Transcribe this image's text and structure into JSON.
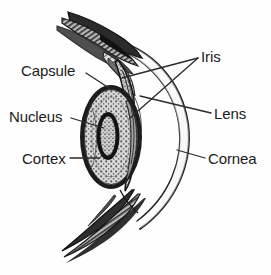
{
  "figure": {
    "style": "grayscale pen-and-ink medical illustration",
    "background_color": "#fefefe",
    "ink_color": "#1b1b1b",
    "leader_line_color": "#2a2a2a"
  },
  "labels": {
    "capsule": "Capsule",
    "nucleus": "Nucleus",
    "cortex": "Cortex",
    "iris": "Iris",
    "lens": "Lens",
    "cornea": "Cornea"
  },
  "structures": [
    {
      "name": "capsule",
      "label": "Capsule",
      "side": "left",
      "description": "outer membrane enclosing the lens"
    },
    {
      "name": "nucleus",
      "label": "Nucleus",
      "side": "left",
      "description": "dense central core of the lens"
    },
    {
      "name": "cortex",
      "label": "Cortex",
      "side": "left",
      "description": "stippled lens fibre layer around the nucleus"
    },
    {
      "name": "iris",
      "label": "Iris",
      "side": "right",
      "description": "pigmented diaphragm, two leader lines to upper and lower leaflets"
    },
    {
      "name": "lens",
      "label": "Lens",
      "side": "right",
      "description": "biconvex crystalline lens body"
    },
    {
      "name": "cornea",
      "label": "Cornea",
      "side": "right",
      "description": "transparent anterior dome"
    }
  ]
}
